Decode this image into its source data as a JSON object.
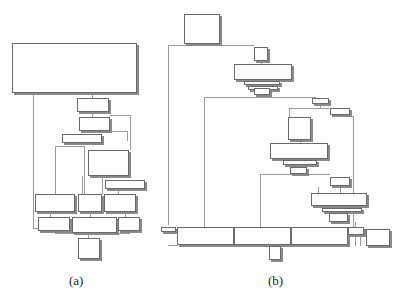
{
  "figure": {
    "panels": [
      {
        "id": "a",
        "caption": "(a)",
        "caption_pos": [
          69,
          273
        ],
        "blocks": [
          [
            12,
            43,
            125,
            50
          ],
          [
            77,
            98,
            32,
            14
          ],
          [
            79,
            117,
            31,
            14
          ],
          [
            62,
            134,
            40,
            9
          ],
          [
            88,
            150,
            41,
            26
          ],
          [
            105,
            180,
            40,
            9
          ],
          [
            35,
            194,
            40,
            18
          ],
          [
            78,
            194,
            24,
            18
          ],
          [
            104,
            194,
            32,
            18
          ],
          [
            38,
            217,
            32,
            14
          ],
          [
            72,
            217,
            45,
            16
          ],
          [
            118,
            217,
            22,
            14
          ],
          [
            78,
            238,
            22,
            21
          ]
        ],
        "edges": [
          [
            33,
            93,
            1,
            135
          ],
          [
            33,
            228,
            5,
            1
          ],
          [
            92,
            93,
            1,
            5
          ],
          [
            92,
            112,
            1,
            5
          ],
          [
            110,
            115,
            20,
            1
          ],
          [
            130,
            115,
            1,
            35
          ],
          [
            110,
            131,
            18,
            1
          ],
          [
            127,
            131,
            1,
            10
          ],
          [
            55,
            146,
            1,
            48
          ],
          [
            55,
            146,
            30,
            1
          ],
          [
            84,
            146,
            1,
            48
          ],
          [
            82,
            176,
            1,
            18
          ],
          [
            102,
            176,
            1,
            18
          ],
          [
            118,
            189,
            1,
            5
          ],
          [
            50,
            212,
            1,
            5
          ],
          [
            90,
            212,
            1,
            5
          ],
          [
            125,
            212,
            1,
            5
          ],
          [
            55,
            233,
            75,
            1
          ],
          [
            88,
            233,
            1,
            5
          ]
        ]
      },
      {
        "id": "b",
        "caption": "(b)",
        "caption_pos": [
          268,
          273
        ],
        "blocks": [
          [
            184,
            14,
            36,
            30
          ],
          [
            254,
            47,
            14,
            14
          ],
          [
            234,
            64,
            58,
            16
          ],
          [
            244,
            81,
            36,
            4
          ],
          [
            248,
            86,
            30,
            4
          ],
          [
            254,
            88,
            16,
            7
          ],
          [
            312,
            98,
            17,
            6
          ],
          [
            330,
            108,
            20,
            7
          ],
          [
            288,
            117,
            23,
            23
          ],
          [
            270,
            143,
            58,
            16
          ],
          [
            283,
            160,
            34,
            5
          ],
          [
            290,
            167,
            17,
            7
          ],
          [
            330,
            177,
            20,
            9
          ],
          [
            311,
            193,
            56,
            13
          ],
          [
            322,
            208,
            40,
            4
          ],
          [
            329,
            213,
            19,
            9
          ],
          [
            161,
            227,
            15,
            5
          ],
          [
            177,
            227,
            57,
            18
          ],
          [
            234,
            227,
            57,
            18
          ],
          [
            291,
            227,
            57,
            18
          ],
          [
            348,
            227,
            16,
            8
          ],
          [
            366,
            229,
            24,
            17
          ],
          [
            269,
            246,
            12,
            14
          ]
        ],
        "edges": [
          [
            168,
            45,
            1,
            180
          ],
          [
            168,
            45,
            86,
            1
          ],
          [
            168,
            245,
            10,
            1
          ],
          [
            261,
            61,
            1,
            3
          ],
          [
            260,
            96,
            1,
            2
          ],
          [
            204,
            97,
            1,
            130
          ],
          [
            204,
            97,
            112,
            1
          ],
          [
            320,
            104,
            1,
            4
          ],
          [
            289,
            108,
            1,
            9
          ],
          [
            289,
            108,
            40,
            1
          ],
          [
            300,
            140,
            1,
            3
          ],
          [
            353,
            116,
            1,
            112
          ],
          [
            340,
            116,
            14,
            1
          ],
          [
            260,
            174,
            1,
            53
          ],
          [
            260,
            174,
            70,
            1
          ],
          [
            318,
            187,
            1,
            6
          ],
          [
            340,
            187,
            1,
            6
          ],
          [
            355,
            222,
            1,
            5
          ],
          [
            274,
            245,
            1,
            1
          ],
          [
            355,
            236,
            1,
            10
          ],
          [
            360,
            236,
            1,
            10
          ]
        ]
      }
    ]
  }
}
